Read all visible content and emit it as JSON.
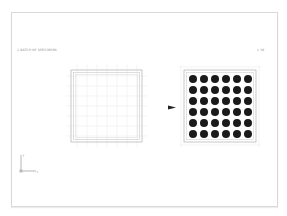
{
  "figure": {
    "left_label": "1 BATCH OF SPECIMENS",
    "right_label": "x 36",
    "axis": {
      "x_label": "x",
      "y_label": "y"
    },
    "left_panel": {
      "description": "empty grid plate",
      "grid_lines": 8
    },
    "right_panel": {
      "description": "plate with specimens",
      "rows": 6,
      "cols": 6,
      "dot_color": "#1a1a1a"
    },
    "arrow": {
      "direction": "right"
    },
    "colors": {
      "frame": "#d8d8d8",
      "grid": "#e6e6e6",
      "plate": "#b8b8b8",
      "dot": "#1a1a1a",
      "arrow": "#222222"
    }
  }
}
